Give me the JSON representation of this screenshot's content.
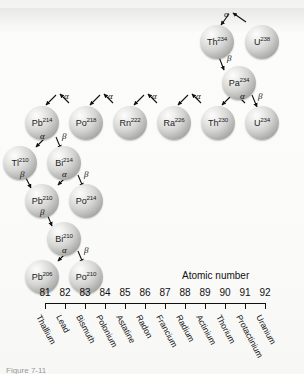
{
  "figure": {
    "caption": "Figure 7-11",
    "axis_title": "Atomic number"
  },
  "axis": {
    "ticks": [
      {
        "number": "81",
        "element": "Thallium"
      },
      {
        "number": "82",
        "element": "Lead"
      },
      {
        "number": "83",
        "element": "Bismuth"
      },
      {
        "number": "84",
        "element": "Polonium"
      },
      {
        "number": "85",
        "element": "Astatine"
      },
      {
        "number": "86",
        "element": "Radon"
      },
      {
        "number": "87",
        "element": "Francium"
      },
      {
        "number": "88",
        "element": "Radium"
      },
      {
        "number": "89",
        "element": "Actinium"
      },
      {
        "number": "90",
        "element": "Thorium"
      },
      {
        "number": "91",
        "element": "Protactinium"
      },
      {
        "number": "92",
        "element": "Uranium"
      }
    ]
  },
  "chart_data": {
    "type": "diagram",
    "xlabel": "Atomic number",
    "xlim": [
      81,
      92
    ],
    "grid": false,
    "legend": null,
    "nodes": [
      {
        "id": "U238",
        "symbol": "U",
        "mass": "238",
        "z": 92,
        "x": 245,
        "y": 25
      },
      {
        "id": "Th234",
        "symbol": "Th",
        "mass": "234",
        "z": 90,
        "x": 200,
        "y": 25
      },
      {
        "id": "Pa234",
        "symbol": "Pa",
        "mass": "234",
        "z": 91,
        "x": 222,
        "y": 66
      },
      {
        "id": "U234",
        "symbol": "U",
        "mass": "234",
        "z": 92,
        "x": 245,
        "y": 106
      },
      {
        "id": "Th230",
        "symbol": "Th",
        "mass": "230",
        "z": 90,
        "x": 201,
        "y": 106
      },
      {
        "id": "Ra226",
        "symbol": "Ra",
        "mass": "226",
        "z": 88,
        "x": 157,
        "y": 106
      },
      {
        "id": "Rn222",
        "symbol": "Rn",
        "mass": "222",
        "z": 86,
        "x": 113,
        "y": 106
      },
      {
        "id": "Po218",
        "symbol": "Po",
        "mass": "218",
        "z": 84,
        "x": 69,
        "y": 106
      },
      {
        "id": "Pb214",
        "symbol": "Pb",
        "mass": "214",
        "z": 82,
        "x": 25,
        "y": 106
      },
      {
        "id": "Bi214",
        "symbol": "Bi",
        "mass": "214",
        "z": 83,
        "x": 47,
        "y": 146
      },
      {
        "id": "Tl210",
        "symbol": "Tl",
        "mass": "210",
        "z": 81,
        "x": 3,
        "y": 146
      },
      {
        "id": "Po214",
        "symbol": "Po",
        "mass": "214",
        "z": 84,
        "x": 69,
        "y": 184
      },
      {
        "id": "Pb210",
        "symbol": "Pb",
        "mass": "210",
        "z": 82,
        "x": 25,
        "y": 184
      },
      {
        "id": "Bi210",
        "symbol": "Bi",
        "mass": "210",
        "z": 83,
        "x": 47,
        "y": 222
      },
      {
        "id": "Po210",
        "symbol": "Po",
        "mass": "210",
        "z": 84,
        "x": 69,
        "y": 260
      },
      {
        "id": "Pb206",
        "symbol": "Pb",
        "mass": "206",
        "z": 82,
        "x": 25,
        "y": 260
      }
    ],
    "decays": [
      {
        "from": "U238",
        "to": "Th234",
        "type": "alpha",
        "symbol": "α"
      },
      {
        "from": "Th234",
        "to": "Pa234",
        "type": "beta",
        "symbol": "β"
      },
      {
        "from": "Pa234",
        "to": "U234",
        "type": "beta",
        "symbol": "β"
      },
      {
        "from": "U234",
        "to": "Th230",
        "type": "alpha",
        "symbol": "α"
      },
      {
        "from": "Th230",
        "to": "Ra226",
        "type": "alpha",
        "symbol": "α"
      },
      {
        "from": "Ra226",
        "to": "Rn222",
        "type": "alpha",
        "symbol": "α"
      },
      {
        "from": "Rn222",
        "to": "Po218",
        "type": "alpha",
        "symbol": "α"
      },
      {
        "from": "Po218",
        "to": "Pb214",
        "type": "alpha",
        "symbol": "α"
      },
      {
        "from": "Pb214",
        "to": "Bi214",
        "type": "beta",
        "symbol": "β"
      },
      {
        "from": "Bi214",
        "to": "Tl210",
        "type": "alpha",
        "symbol": "α"
      },
      {
        "from": "Bi214",
        "to": "Po214",
        "type": "beta",
        "symbol": "β"
      },
      {
        "from": "Tl210",
        "to": "Pb210",
        "type": "beta",
        "symbol": "β"
      },
      {
        "from": "Po214",
        "to": "Pb210",
        "type": "alpha",
        "symbol": "α"
      },
      {
        "from": "Pb210",
        "to": "Bi210",
        "type": "beta",
        "symbol": "β"
      },
      {
        "from": "Bi210",
        "to": "Pb206",
        "type": "alpha",
        "symbol": "α"
      },
      {
        "from": "Bi210",
        "to": "Po210",
        "type": "beta",
        "symbol": "β"
      }
    ],
    "decay_marks": [
      {
        "label": "α",
        "x": 224,
        "y": 10
      },
      {
        "label": "β",
        "x": 227,
        "y": 54
      },
      {
        "label": "β",
        "x": 258,
        "y": 92
      },
      {
        "label": "α",
        "x": 240,
        "y": 92
      },
      {
        "label": "α",
        "x": 196,
        "y": 92
      },
      {
        "label": "α",
        "x": 152,
        "y": 92
      },
      {
        "label": "α",
        "x": 108,
        "y": 92
      },
      {
        "label": "α",
        "x": 64,
        "y": 92
      },
      {
        "label": "α",
        "x": 40,
        "y": 132
      },
      {
        "label": "β",
        "x": 62,
        "y": 132
      },
      {
        "label": "β",
        "x": 20,
        "y": 170
      },
      {
        "label": "α",
        "x": 62,
        "y": 170
      },
      {
        "label": "β",
        "x": 84,
        "y": 170
      },
      {
        "label": "β",
        "x": 40,
        "y": 208
      },
      {
        "label": "α",
        "x": 62,
        "y": 246
      },
      {
        "label": "β",
        "x": 84,
        "y": 246
      }
    ]
  }
}
